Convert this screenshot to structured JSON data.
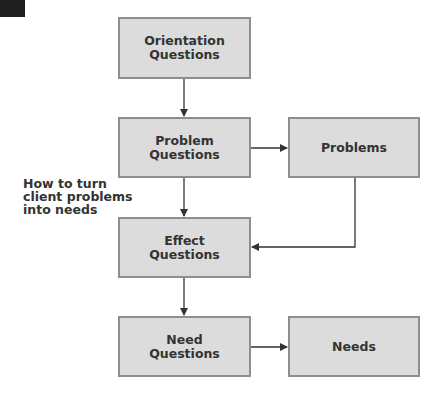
{
  "diagram": {
    "side_label": "How to turn\nclient problems\ninto needs",
    "nodes": [
      {
        "id": "orientation",
        "label": "Orientation\nQuestions"
      },
      {
        "id": "problem-questions",
        "label": "Problem\nQuestions"
      },
      {
        "id": "problems",
        "label": "Problems"
      },
      {
        "id": "effect",
        "label": "Effect\nQuestions"
      },
      {
        "id": "need-questions",
        "label": "Need\nQuestions"
      },
      {
        "id": "needs",
        "label": "Needs"
      }
    ],
    "edges": [
      {
        "from": "orientation",
        "to": "problem-questions"
      },
      {
        "from": "problem-questions",
        "to": "problems"
      },
      {
        "from": "problem-questions",
        "to": "effect"
      },
      {
        "from": "problems",
        "to": "effect"
      },
      {
        "from": "effect",
        "to": "need-questions"
      },
      {
        "from": "need-questions",
        "to": "needs"
      }
    ],
    "colors": {
      "box_fill": "#dcdcdc",
      "box_border": "#8e8e8e",
      "line": "#333333",
      "text": "#333333"
    }
  }
}
